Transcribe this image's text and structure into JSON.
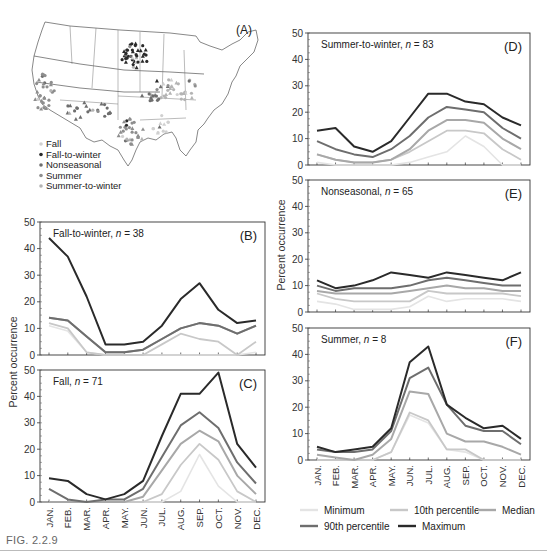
{
  "figure": {
    "caption": "FIG. 2.2.9",
    "shared_ylabel": "Percent occurrence",
    "months": [
      "JAN.",
      "FEB.",
      "MAR.",
      "APR.",
      "MAY.",
      "JUN.",
      "JUL.",
      "AUG.",
      "SEP.",
      "OCT.",
      "NOV.",
      "DEC."
    ],
    "series_colors": {
      "Minimum": "#e4e4e4",
      "10th percentile": "#c8c8c8",
      "Median": "#a8a8a8",
      "90th percentile": "#6e6e6e",
      "Maximum": "#2a2a2a"
    },
    "legend": [
      {
        "label": "Minimum",
        "color": "#e4e4e4"
      },
      {
        "label": "10th percentile",
        "color": "#c8c8c8"
      },
      {
        "label": "Median",
        "color": "#a8a8a8"
      },
      {
        "label": "90th percentile",
        "color": "#6e6e6e"
      },
      {
        "label": "Maximum",
        "color": "#2a2a2a"
      }
    ]
  },
  "map": {
    "label": "(A)",
    "legend": [
      {
        "label": "Fall",
        "color": "#d0d0d0"
      },
      {
        "label": "Fall-to-winter",
        "color": "#2a2a2a"
      },
      {
        "label": "Nonseasonal",
        "color": "#6e6e6e"
      },
      {
        "label": "Summer",
        "color": "#8e8e8e"
      },
      {
        "label": "Summer-to-winter",
        "color": "#b4b4b4"
      }
    ]
  },
  "chart_data": [
    {
      "panel": "(B)",
      "type": "line",
      "title": "Fall-to-winter, n = 38",
      "group": "Fall-to-winter",
      "n": 38,
      "xlabel": "",
      "ylabel": "Percent occurrence",
      "ylim": [
        0,
        50
      ],
      "yticks": [
        0,
        10,
        20,
        30,
        40,
        50
      ],
      "categories": [
        "JAN.",
        "FEB.",
        "MAR.",
        "APR.",
        "MAY.",
        "JUN.",
        "JUL.",
        "AUG.",
        "SEP.",
        "OCT.",
        "NOV.",
        "DEC."
      ],
      "series": [
        {
          "name": "Minimum",
          "values": [
            11,
            9,
            1,
            0,
            0,
            0,
            0,
            0,
            0,
            0,
            0,
            1
          ]
        },
        {
          "name": "10th percentile",
          "values": [
            12,
            10,
            1,
            0,
            0,
            0,
            4,
            8,
            6,
            5,
            0,
            5
          ]
        },
        {
          "name": "Median",
          "values": [
            14,
            13,
            7,
            1,
            1,
            2,
            6,
            10,
            12,
            11,
            8,
            11
          ]
        },
        {
          "name": "90th percentile",
          "values": [
            14,
            13,
            7,
            1,
            1,
            2,
            6,
            10,
            12,
            11,
            8,
            11
          ]
        },
        {
          "name": "Maximum",
          "values": [
            44,
            37,
            22,
            4,
            4,
            5,
            11,
            21,
            27,
            17,
            12,
            13
          ]
        }
      ]
    },
    {
      "panel": "(C)",
      "type": "line",
      "title": "Fall, n = 71",
      "group": "Fall",
      "n": 71,
      "xlabel": "",
      "ylabel": "Percent occurrence",
      "ylim": [
        0,
        50
      ],
      "yticks": [
        0,
        10,
        20,
        30,
        40,
        50
      ],
      "categories": [
        "JAN.",
        "FEB.",
        "MAR.",
        "APR.",
        "MAY.",
        "JUN.",
        "JUL.",
        "AUG.",
        "SEP.",
        "OCT.",
        "NOV.",
        "DEC."
      ],
      "series": [
        {
          "name": "Minimum",
          "values": [
            0,
            0,
            0,
            0,
            0,
            0,
            0,
            4,
            18,
            6,
            0,
            0
          ]
        },
        {
          "name": "10th percentile",
          "values": [
            0,
            0,
            0,
            0,
            0,
            0,
            3,
            14,
            22,
            16,
            4,
            0
          ]
        },
        {
          "name": "Median",
          "values": [
            0,
            0,
            0,
            0,
            0,
            2,
            12,
            22,
            27,
            23,
            10,
            3
          ]
        },
        {
          "name": "90th percentile",
          "values": [
            5,
            1,
            0,
            1,
            1,
            5,
            17,
            29,
            34,
            28,
            15,
            7
          ]
        },
        {
          "name": "Maximum",
          "values": [
            9,
            8,
            3,
            1,
            3,
            8,
            25,
            41,
            41,
            49,
            22,
            13
          ]
        }
      ]
    },
    {
      "panel": "(D)",
      "type": "line",
      "title": "Summer-to-winter, n = 83",
      "group": "Summer-to-winter",
      "n": 83,
      "xlabel": "",
      "ylabel": "Percent occurrence",
      "ylim": [
        0,
        50
      ],
      "yticks": [
        0,
        10,
        20,
        30,
        40,
        50
      ],
      "categories": [
        "JAN.",
        "FEB.",
        "MAR.",
        "APR.",
        "MAY.",
        "JUN.",
        "JUL.",
        "AUG.",
        "SEP.",
        "OCT.",
        "NOV.",
        "DEC."
      ],
      "series": [
        {
          "name": "Minimum",
          "values": [
            1,
            0,
            0,
            0,
            0,
            1,
            3,
            5,
            11,
            7,
            0,
            0
          ]
        },
        {
          "name": "10th percentile",
          "values": [
            4,
            2,
            1,
            1,
            2,
            5,
            9,
            13,
            13,
            12,
            6,
            2
          ]
        },
        {
          "name": "Median",
          "values": [
            4,
            2,
            1,
            1,
            2,
            6,
            13,
            17,
            17,
            16,
            10,
            6
          ]
        },
        {
          "name": "90th percentile",
          "values": [
            9,
            6,
            4,
            3,
            6,
            11,
            18,
            22,
            21,
            20,
            14,
            10
          ]
        },
        {
          "name": "Maximum",
          "values": [
            13,
            14,
            7,
            5,
            9,
            18,
            27,
            27,
            24,
            23,
            18,
            15
          ]
        }
      ]
    },
    {
      "panel": "(E)",
      "type": "line",
      "title": "Nonseasonal, n = 65",
      "group": "Nonseasonal",
      "n": 65,
      "xlabel": "",
      "ylabel": "Percent occurrence",
      "ylim": [
        0,
        50
      ],
      "yticks": [
        0,
        10,
        20,
        30,
        40,
        50
      ],
      "categories": [
        "JAN.",
        "FEB.",
        "MAR.",
        "APR.",
        "MAY.",
        "JUN.",
        "JUL.",
        "AUG.",
        "SEP.",
        "OCT.",
        "NOV.",
        "DEC."
      ],
      "series": [
        {
          "name": "Minimum",
          "values": [
            4,
            3,
            1,
            1,
            1,
            2,
            6,
            4,
            5,
            5,
            5,
            4
          ]
        },
        {
          "name": "10th percentile",
          "values": [
            7,
            5,
            4,
            4,
            4,
            4,
            8,
            7,
            7,
            7,
            7,
            6
          ]
        },
        {
          "name": "Median",
          "values": [
            8,
            7,
            7,
            7,
            7,
            8,
            9,
            10,
            9,
            9,
            8,
            8
          ]
        },
        {
          "name": "90th percentile",
          "values": [
            10,
            8,
            9,
            9,
            9,
            10,
            12,
            13,
            12,
            11,
            10,
            10
          ]
        },
        {
          "name": "Maximum",
          "values": [
            12,
            9,
            10,
            12,
            15,
            14,
            13,
            15,
            14,
            13,
            12,
            15
          ]
        }
      ]
    },
    {
      "panel": "(F)",
      "type": "line",
      "title": "Summer, n = 8",
      "group": "Summer",
      "n": 8,
      "xlabel": "",
      "ylabel": "Percent occurrence",
      "ylim": [
        0,
        50
      ],
      "yticks": [
        0,
        10,
        20,
        30,
        40,
        50
      ],
      "categories": [
        "JAN.",
        "FEB.",
        "MAR.",
        "APR.",
        "MAY.",
        "JUN.",
        "JUL.",
        "AUG.",
        "SEP.",
        "OCT.",
        "NOV.",
        "DEC."
      ],
      "series": [
        {
          "name": "Minimum",
          "values": [
            0,
            0,
            0,
            0,
            3,
            17,
            14,
            4,
            3,
            0,
            0,
            0
          ]
        },
        {
          "name": "10th percentile",
          "values": [
            0,
            0,
            0,
            0,
            3,
            18,
            15,
            4,
            4,
            0,
            0,
            0
          ]
        },
        {
          "name": "Median",
          "values": [
            2,
            1,
            0,
            2,
            8,
            26,
            25,
            10,
            7,
            7,
            5,
            2
          ]
        },
        {
          "name": "90th percentile",
          "values": [
            4,
            3,
            3,
            4,
            11,
            31,
            35,
            21,
            13,
            11,
            11,
            6
          ]
        },
        {
          "name": "Maximum",
          "values": [
            5,
            3,
            4,
            5,
            12,
            37,
            43,
            21,
            16,
            12,
            13,
            8
          ]
        }
      ]
    }
  ]
}
